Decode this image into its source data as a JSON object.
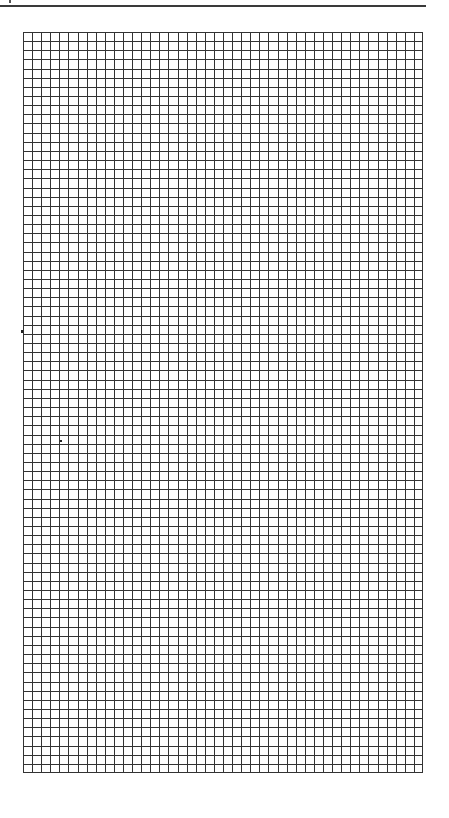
{
  "page": {
    "type": "graph-paper",
    "background_color": "#ffffff",
    "line_color": "#333333"
  },
  "header_rule": {
    "visible": true,
    "x_start": 0,
    "x_end": 426,
    "y": 6
  },
  "grid": {
    "x": 23,
    "y": 32,
    "width": 400,
    "height": 741,
    "columns": 44,
    "rows": 81,
    "line_color": "#333333",
    "line_width": 1
  },
  "artifacts": [
    {
      "name": "stray-mark-left-edge",
      "x": 21,
      "y": 330,
      "w": 2,
      "h": 3
    },
    {
      "name": "stray-mark-interior",
      "x": 60,
      "y": 440,
      "w": 2,
      "h": 2
    }
  ]
}
